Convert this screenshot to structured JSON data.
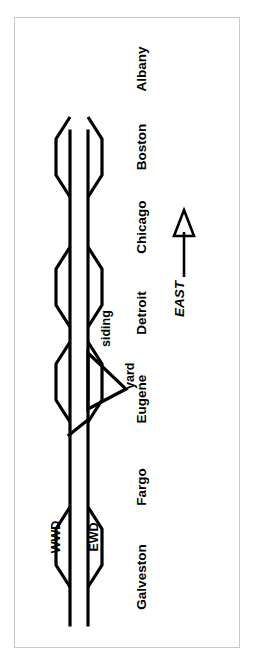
{
  "figure": {
    "caption": "Fig 15-21 (above) Track arrangement for the two track current of traffic with sidings example. EWD is the Eastward track. WWD",
    "colors": {
      "ink": "#000000",
      "frame": "#c9c9c9",
      "background": "#ffffff"
    }
  },
  "diagram": {
    "track_labels": {
      "westward": "WWD",
      "eastward": "EWD"
    },
    "feature_labels": {
      "siding": "siding",
      "yard": "yard"
    },
    "direction_label": "EAST",
    "stations": [
      "Galveston",
      "Fargo",
      "Eugene",
      "Detroit",
      "Chicago",
      "Boston",
      "Albany"
    ]
  }
}
